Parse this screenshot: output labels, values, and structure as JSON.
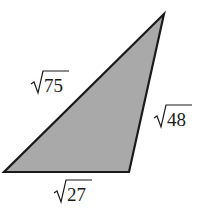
{
  "diagram": {
    "type": "triangle",
    "fill_color": "#a9a9a9",
    "stroke_color": "#1a1a1a",
    "vertices": {
      "top": [
        164,
        14
      ],
      "bottom_left": [
        4,
        172
      ],
      "bottom_right": [
        129,
        172
      ]
    },
    "sides": [
      {
        "name": "hypotenuse",
        "radicand": "75",
        "label": "√75"
      },
      {
        "name": "right-side",
        "radicand": "48",
        "label": "√48"
      },
      {
        "name": "bottom-side",
        "radicand": "27",
        "label": "√27"
      }
    ]
  }
}
